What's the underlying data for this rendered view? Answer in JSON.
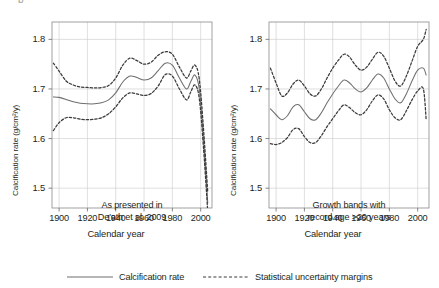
{
  "figure": {
    "corner_mark": "b",
    "legend": {
      "items": [
        {
          "label": "Calcification rate",
          "style": "solid",
          "color": "#6e6e6e"
        },
        {
          "label": "Statistical uncertainty margins",
          "style": "dashed",
          "color": "#3a3a3a"
        }
      ]
    }
  },
  "chart_data": [
    {
      "type": "line",
      "panel": "left",
      "title": "",
      "annotation": "As presented in\nDe'ath et al. 2009",
      "annotation_lines": [
        "As presented in",
        "De'ath et al. 2009"
      ],
      "xlabel": "Calendar year",
      "ylabel": "Calcification rate (g/cm²/y)",
      "xlim": [
        1895,
        2008
      ],
      "ylim": [
        1.46,
        1.835
      ],
      "xticks": [
        1900,
        1920,
        1940,
        1960,
        1980,
        2000
      ],
      "yticks": [
        1.5,
        1.6,
        1.7,
        1.8
      ],
      "ytick_labels": [
        "1.5",
        "1.6",
        "1.7",
        "1.8"
      ],
      "grid": true,
      "legend_position": "below-figure",
      "series": [
        {
          "name": "Calcification rate",
          "style": "solid",
          "x": [
            1896,
            1900,
            1905,
            1910,
            1915,
            1920,
            1925,
            1930,
            1935,
            1940,
            1945,
            1950,
            1955,
            1960,
            1965,
            1970,
            1975,
            1980,
            1985,
            1990,
            1993,
            1996,
            1999,
            2002,
            2005
          ],
          "y": [
            1.684,
            1.683,
            1.679,
            1.674,
            1.671,
            1.67,
            1.67,
            1.672,
            1.678,
            1.692,
            1.714,
            1.726,
            1.723,
            1.718,
            1.722,
            1.737,
            1.752,
            1.748,
            1.722,
            1.7,
            1.715,
            1.728,
            1.7,
            1.6,
            1.47
          ]
        },
        {
          "name": "Upper uncertainty margin",
          "style": "dashed",
          "x": [
            1896,
            1900,
            1905,
            1910,
            1915,
            1920,
            1925,
            1930,
            1935,
            1940,
            1945,
            1950,
            1955,
            1960,
            1965,
            1970,
            1975,
            1980,
            1985,
            1990,
            1993,
            1996,
            1999,
            2002,
            2005
          ],
          "y": [
            1.752,
            1.736,
            1.716,
            1.708,
            1.704,
            1.703,
            1.702,
            1.703,
            1.707,
            1.722,
            1.748,
            1.762,
            1.757,
            1.75,
            1.754,
            1.768,
            1.775,
            1.77,
            1.744,
            1.722,
            1.736,
            1.748,
            1.72,
            1.62,
            1.492
          ]
        },
        {
          "name": "Lower uncertainty margin",
          "style": "dashed",
          "x": [
            1896,
            1900,
            1905,
            1910,
            1915,
            1920,
            1925,
            1930,
            1935,
            1940,
            1945,
            1950,
            1955,
            1960,
            1965,
            1970,
            1975,
            1980,
            1985,
            1990,
            1993,
            1996,
            1999,
            2002,
            2005
          ],
          "y": [
            1.616,
            1.632,
            1.642,
            1.642,
            1.639,
            1.638,
            1.639,
            1.642,
            1.65,
            1.664,
            1.682,
            1.692,
            1.69,
            1.687,
            1.691,
            1.706,
            1.729,
            1.726,
            1.7,
            1.678,
            1.694,
            1.708,
            1.681,
            1.581,
            1.452
          ]
        }
      ]
    },
    {
      "type": "line",
      "panel": "right",
      "title": "",
      "annotation": "Growth bands with\nrecord age >20 years",
      "annotation_lines": [
        "Growth bands with",
        "record age >20 years"
      ],
      "xlabel": "Calendar year",
      "ylabel": "Calcification rate (g/cm²/y)",
      "xlim": [
        1895,
        2008
      ],
      "ylim": [
        1.46,
        1.835
      ],
      "xticks": [
        1900,
        1920,
        1940,
        1960,
        1980,
        2000
      ],
      "yticks": [
        1.5,
        1.6,
        1.7,
        1.8
      ],
      "ytick_labels": [
        "1.5",
        "1.6",
        "1.7",
        "1.8"
      ],
      "grid": true,
      "legend_position": "below-figure",
      "series": [
        {
          "name": "Calcification rate",
          "style": "solid",
          "x": [
            1896,
            1900,
            1904,
            1908,
            1912,
            1916,
            1920,
            1924,
            1928,
            1932,
            1936,
            1940,
            1944,
            1948,
            1952,
            1956,
            1960,
            1964,
            1968,
            1972,
            1976,
            1980,
            1984,
            1988,
            1992,
            1996,
            2000,
            2004,
            2006
          ],
          "y": [
            1.66,
            1.648,
            1.638,
            1.646,
            1.664,
            1.668,
            1.654,
            1.64,
            1.638,
            1.652,
            1.672,
            1.69,
            1.706,
            1.718,
            1.712,
            1.7,
            1.694,
            1.702,
            1.718,
            1.73,
            1.722,
            1.7,
            1.68,
            1.672,
            1.69,
            1.716,
            1.738,
            1.742,
            1.728
          ]
        },
        {
          "name": "Upper uncertainty margin",
          "style": "dashed",
          "x": [
            1896,
            1900,
            1904,
            1908,
            1912,
            1916,
            1920,
            1924,
            1928,
            1932,
            1936,
            1940,
            1944,
            1948,
            1952,
            1956,
            1960,
            1964,
            1968,
            1972,
            1976,
            1980,
            1984,
            1988,
            1992,
            1996,
            2000,
            2004,
            2006
          ],
          "y": [
            1.742,
            1.712,
            1.686,
            1.692,
            1.71,
            1.718,
            1.706,
            1.69,
            1.686,
            1.7,
            1.722,
            1.742,
            1.758,
            1.77,
            1.764,
            1.748,
            1.738,
            1.744,
            1.76,
            1.774,
            1.766,
            1.742,
            1.716,
            1.706,
            1.726,
            1.756,
            1.786,
            1.8,
            1.82
          ]
        },
        {
          "name": "Lower uncertainty margin",
          "style": "dashed",
          "x": [
            1896,
            1900,
            1904,
            1908,
            1912,
            1916,
            1920,
            1924,
            1928,
            1932,
            1936,
            1940,
            1944,
            1948,
            1952,
            1956,
            1960,
            1964,
            1968,
            1972,
            1976,
            1980,
            1984,
            1988,
            1992,
            1996,
            2000,
            2004,
            2006
          ],
          "y": [
            1.59,
            1.588,
            1.592,
            1.602,
            1.618,
            1.62,
            1.604,
            1.592,
            1.592,
            1.606,
            1.624,
            1.64,
            1.656,
            1.668,
            1.662,
            1.652,
            1.648,
            1.658,
            1.676,
            1.688,
            1.68,
            1.658,
            1.642,
            1.638,
            1.656,
            1.678,
            1.696,
            1.7,
            1.638
          ]
        }
      ]
    }
  ]
}
